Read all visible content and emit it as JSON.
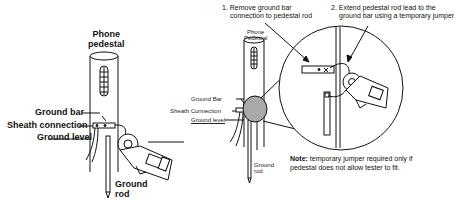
{
  "left_figure": {
    "title_line1": "Phone",
    "title_line2": "pedestal",
    "labels": {
      "ground_bar": "Ground bar",
      "sheath_connection": "Sheath connection",
      "ground_level": "Ground level",
      "ground_rod_line1": "Ground",
      "ground_rod_line2": "rod"
    }
  },
  "right_figure": {
    "title_line1": "Phone",
    "title_line2": "Pedestal",
    "labels": {
      "ground_bar": "Ground Bar",
      "sheath_connection": "Sheath Connection",
      "ground_level": "Ground level",
      "ground_rod_line1": "Ground",
      "ground_rod_line2": "rod"
    },
    "steps": [
      {
        "line1": "1. Remove ground bar",
        "line2": "connection to pedestal rod"
      },
      {
        "line1": "2. Extend pedestal rod lead to the",
        "line2": "ground bar using a temporary jumper"
      }
    ],
    "note": {
      "label": "Note:",
      "line1": "temporary jumper required only if",
      "line2": "pedestal does not allow tester to fit."
    }
  },
  "colors": {
    "ink": "#111111",
    "magnifier_fill": "#a9a9a9",
    "background": "#ffffff"
  }
}
